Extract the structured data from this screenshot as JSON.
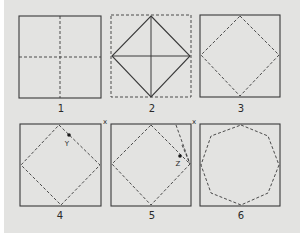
{
  "figure": {
    "background_color": "#e3e3e1",
    "line_color": "#3a3a3a",
    "panels": [
      {
        "label": "1",
        "description": "Square folded in half both ways (dashed center creases)"
      },
      {
        "label": "2",
        "description": "Dashed square outline with solid inscribed diamond and center cross"
      },
      {
        "label": "3",
        "description": "Solid square with dashed inscribed diamond"
      },
      {
        "label": "4",
        "description": "Square with dashed diamond, corner marked X and point Y",
        "corner_mark": "x",
        "point_label": "Y"
      },
      {
        "label": "5",
        "description": "Corner X folded toward point Z",
        "corner_mark": "x",
        "point_label": "Z"
      },
      {
        "label": "6",
        "description": "Square with dashed octagon"
      }
    ]
  }
}
